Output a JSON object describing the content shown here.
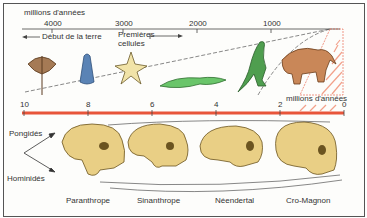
{
  "top_timeline": {
    "unit_label": "millions d'années",
    "ticks": [
      "4000",
      "3000",
      "2000",
      "1000"
    ],
    "start_annotation": "Début de la terre",
    "event_annotation": "Premières cellules",
    "event_annotation_line1": "Premières",
    "event_annotation_line2": "cellules"
  },
  "bottom_timeline": {
    "unit_label": "millions d'années",
    "ticks": [
      "10",
      "8",
      "6",
      "4",
      "2",
      "0"
    ],
    "axis_color": "#e8553a"
  },
  "organisms": [
    "trilobite",
    "cone-shell",
    "starfish",
    "crocodile",
    "dinosaur",
    "mammoth"
  ],
  "lineages": {
    "upper": "Pongidés",
    "lower": "Hominidés"
  },
  "skulls": [
    {
      "label": "Paranthrope"
    },
    {
      "label": "Sinanthrope"
    },
    {
      "label": "Néendertal"
    },
    {
      "label": "Cro-Magnon"
    }
  ],
  "colors": {
    "skull_fill": "#e9cf85",
    "skull_outline": "#6b5420",
    "timeline_red": "#e8553a",
    "hatch": "#f2a08a"
  }
}
